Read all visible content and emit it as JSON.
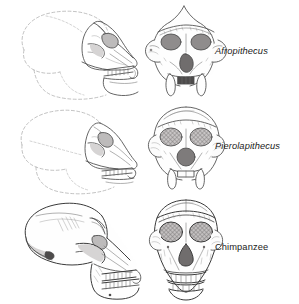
{
  "figure": {
    "type": "comparative-anatomy-illustration",
    "background_color": "#ffffff",
    "line_color": "#4a4a4a",
    "reconstruction_line_color": "#a8a8a8",
    "columns": [
      "lateral view",
      "frontal view"
    ],
    "rows": [
      {
        "id": "afropithecus",
        "label": "Afropithecus",
        "label_style": "italic",
        "views": {
          "lateral": {
            "name": "afropithecus-lateral-skull",
            "reconstructed": true,
            "features": [
              "dashed reconstructed braincase",
              "dashed mandible outline",
              "projecting snout",
              "tooth row",
              "orbit",
              "zygomatic arch"
            ]
          },
          "frontal": {
            "name": "afropithecus-frontal-skull",
            "reconstructed": false,
            "features": [
              "pointed sagittal crest",
              "shaded orbits",
              "nasal aperture",
              "large canines",
              "incisors",
              "flaring zygomatics"
            ]
          }
        }
      },
      {
        "id": "pierolapithecus",
        "label": "Pierolapithecus",
        "label_style": "italic",
        "views": {
          "lateral": {
            "name": "pierolapithecus-lateral-skull",
            "reconstructed": true,
            "features": [
              "dashed reconstructed braincase",
              "dashed mandible outline",
              "rounded cranial vault",
              "tooth row",
              "orbit"
            ]
          },
          "frontal": {
            "name": "pierolapithecus-frontal-skull",
            "reconstructed": false,
            "features": [
              "cross-hatched orbits",
              "rounded nasal aperture",
              "canines",
              "broad face",
              "supraorbital torus"
            ]
          }
        }
      },
      {
        "id": "chimpanzee",
        "label": "Chimpanzee",
        "label_style": "roman",
        "views": {
          "lateral": {
            "name": "chimpanzee-lateral-skull",
            "reconstructed": false,
            "features": [
              "complete cranium",
              "deep mandible",
              "full tooth row",
              "prognathic snout",
              "temporal lines",
              "zygomatic arch",
              "auditory meatus"
            ]
          },
          "frontal": {
            "name": "chimpanzee-frontal-skull",
            "reconstructed": false,
            "features": [
              "cross-hatched orbits",
              "triangular nasal aperture",
              "full upper and lower tooth rows",
              "supraorbital torus",
              "broad zygomatics"
            ]
          }
        }
      }
    ]
  }
}
